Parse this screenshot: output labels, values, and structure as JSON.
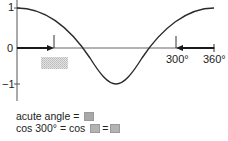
{
  "diagram": {
    "type": "cosine-graph",
    "y_axis": {
      "ticks": [
        "1",
        "0",
        "−1"
      ]
    },
    "x_axis": {
      "labels": [
        "300°",
        "360°"
      ]
    },
    "curve": "y = cos x, 0° to 360°",
    "arrows": [
      {
        "from": "0",
        "direction": "right",
        "marks": "acute angle"
      },
      {
        "from": "360°",
        "direction": "left",
        "to": "300°"
      }
    ],
    "shaded_answer_box": {
      "color": "#d0d0d0",
      "pattern": "dotted"
    }
  },
  "labels": {
    "y_one": "1",
    "y_zero": "0",
    "y_minus_one": "−1",
    "x_300": "300°",
    "x_360": "360°"
  },
  "equations": {
    "line1": {
      "text": "acute angle ="
    },
    "line2": {
      "part1": "cos 300° = cos",
      "eq": "="
    }
  },
  "colors": {
    "line": "#2a2a2a",
    "answer_box": "#a8a8a8",
    "shaded_box": "#d4d4d4"
  }
}
